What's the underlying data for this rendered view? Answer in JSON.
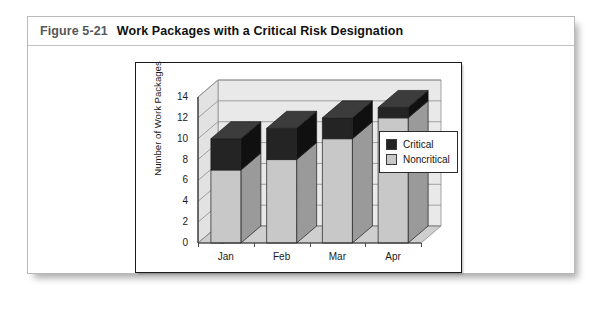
{
  "figure": {
    "number": "Figure 5-21",
    "title": "Work Packages with a Critical Risk Designation"
  },
  "legend": {
    "position": "inside-right",
    "items": [
      {
        "label": "Critical",
        "color": "#242424"
      },
      {
        "label": "Noncritical",
        "color": "#c8c8c8"
      }
    ]
  },
  "colors": {
    "critical": "#242424",
    "critical_side": "#101010",
    "critical_top": "#3c3c3c",
    "noncritical": "#c8c8c8",
    "noncritical_side": "#9a9a9a",
    "noncritical_top": "#dcdcdc",
    "plot_back": "#e9e9e9",
    "plot_floor": "#cfcfcf",
    "gridline": "#8d8d8d",
    "axis": "#2a2a2a",
    "frame": "#1a1a1a",
    "panel_border": "#b9b9b9",
    "caption_number": "#575757",
    "caption_title": "#111111"
  },
  "chart_data": {
    "type": "bar",
    "subtype": "stacked-column-3d",
    "title": "",
    "xlabel": "",
    "ylabel": "Number of Work Packages",
    "categories": [
      "Jan",
      "Feb",
      "Mar",
      "Apr"
    ],
    "series": [
      {
        "name": "Noncritical",
        "values": [
          7,
          8,
          10,
          12
        ],
        "color": "#c8c8c8"
      },
      {
        "name": "Critical",
        "values": [
          3,
          3,
          2,
          1
        ],
        "color": "#242424"
      }
    ],
    "totals": [
      10,
      11,
      12,
      13
    ],
    "ylim": [
      0,
      14
    ],
    "ytick_step": 2,
    "yticks": [
      0,
      2,
      4,
      6,
      8,
      10,
      12,
      14
    ],
    "ytick_labels": [
      "0",
      "2",
      "4",
      "6",
      "8",
      "10",
      "12",
      "14"
    ],
    "grid": true,
    "grid_axis": "y",
    "legend": true,
    "legend_position": "inside-right"
  }
}
